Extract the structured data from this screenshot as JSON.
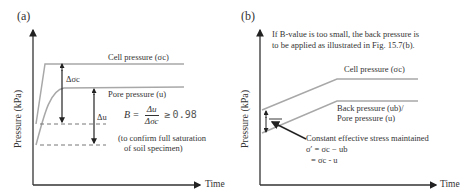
{
  "panel_a": {
    "tag": "(a)",
    "y_axis_label": "Pressure (kPa)",
    "x_axis_label": "Time",
    "cell_pressure_label": "Cell pressure (σc)",
    "pore_pressure_label": "Pore pressure (u)",
    "delta_sigma_label": "Δσc",
    "delta_u_label": "Δu",
    "formula": {
      "lhs": "B =",
      "numerator": "Δu",
      "denominator": "Δσc",
      "relation": "≥",
      "threshold": "0.98"
    },
    "note_line1": "(to confirm full saturation",
    "note_line2": "of soil specimen)"
  },
  "panel_b": {
    "tag": "(b)",
    "y_axis_label": "Pressure (kPa)",
    "x_axis_label": "Time",
    "header_line1": "If B-value is too small, the back pressure is",
    "header_line2": "to be applied as  illustrated in Fig. 15.7(b).",
    "cell_pressure_label": "Cell pressure (σc)",
    "back_pressure_label": "Back pressure (ub)/",
    "pore_pressure_label": "Pore pressure (u)",
    "annotation_line1": "Constant effective stress maintained",
    "annotation_line2": "σ′ =  σc − ub",
    "annotation_line3": "= σc - u"
  },
  "colors": {
    "curve": "#a8a8a8",
    "axis": "#333333",
    "arrow": "#222222",
    "dashed": "#777777"
  }
}
